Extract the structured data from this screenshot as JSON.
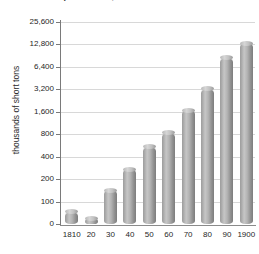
{
  "chart_data": {
    "type": "bar",
    "title": "U.S. coal production, 1810-1900",
    "title_clipped": true,
    "xlabel": "",
    "ylabel": "thousands of short tons",
    "categories": [
      "1810",
      "20",
      "30",
      "40",
      "50",
      "60",
      "70",
      "80",
      "90",
      "1900"
    ],
    "values": [
      55,
      25,
      150,
      290,
      580,
      850,
      1700,
      3300,
      9000,
      13500
    ],
    "ytick_labels": [
      "0",
      "100",
      "200",
      "400",
      "800",
      "1,600",
      "3,200",
      "6,400",
      "12,800",
      "25,600"
    ],
    "ytick_values": [
      0,
      100,
      200,
      400,
      800,
      1600,
      3200,
      6400,
      12800,
      25600
    ],
    "yscale": "doubling",
    "ylim": [
      0,
      25600
    ],
    "grid": true,
    "legend": "none",
    "bar_style": "3d-cylinder",
    "colors": {
      "bar_light": "#c6c6c6",
      "bar_mid": "#a8a8a8",
      "bar_dark": "#7d7d7d",
      "gridline": "#d8d8d8",
      "axis": "#7a7a7a",
      "text": "#1f1f1f",
      "background": "#ffffff"
    }
  },
  "axis": {
    "y_title": "thousands of short tons"
  }
}
